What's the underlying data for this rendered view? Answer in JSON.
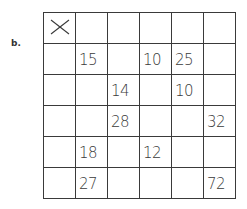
{
  "label": "b.",
  "grid": {
    "corner_symbol": "x-mark",
    "rows": [
      [
        "",
        "",
        "",
        "",
        "",
        ""
      ],
      [
        "",
        "15",
        "",
        "10",
        "25",
        ""
      ],
      [
        "",
        "",
        "14",
        "",
        "10",
        ""
      ],
      [
        "",
        "",
        "28",
        "",
        "",
        "32"
      ],
      [
        "",
        "18",
        "",
        "12",
        "",
        ""
      ],
      [
        "",
        "27",
        "",
        "",
        "",
        "72"
      ]
    ]
  }
}
